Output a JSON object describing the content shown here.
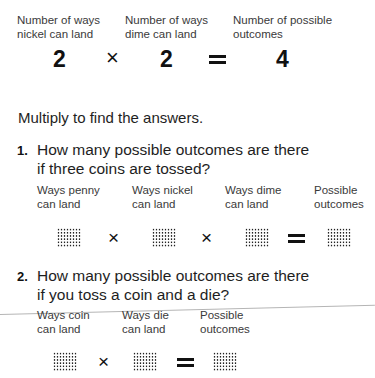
{
  "example": {
    "labels": [
      "Number of ways\nnickel can land",
      "Number of ways\ndime can land",
      "Number of possible\noutcomes"
    ],
    "values": [
      "2",
      "2",
      "4"
    ],
    "operators": [
      "×",
      "="
    ]
  },
  "instruction": "Multiply to find the answers.",
  "questions": [
    {
      "number": "1.",
      "text": "How many possible outcomes are there\nif three coins are tossed?",
      "labels": [
        "Ways penny\ncan land",
        "Ways nickel\ncan land",
        "Ways dime\ncan land",
        "Possible\noutcomes"
      ],
      "operators": [
        "×",
        "×",
        "="
      ],
      "answer_boxes": 4
    },
    {
      "number": "2.",
      "text": "How many possible outcomes are there\nif you toss a coin and a die?",
      "labels": [
        "Ways coin\ncan land",
        "Ways die\ncan land",
        "Possible\noutcomes"
      ],
      "operators": [
        "×",
        "="
      ],
      "answer_boxes": 3
    }
  ]
}
